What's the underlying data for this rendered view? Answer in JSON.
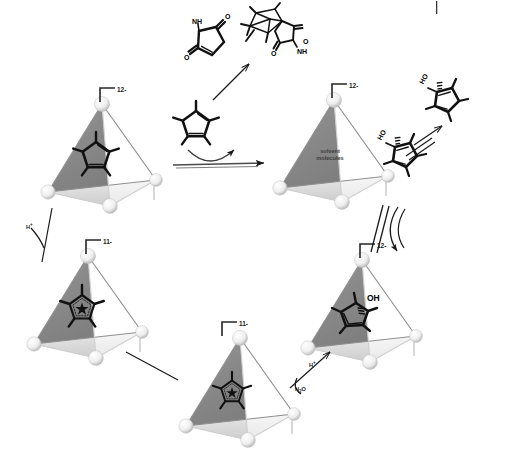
{
  "figure": {
    "type": "reaction-cycle-diagram",
    "background_color": "#ffffff"
  },
  "palette": {
    "face_dark": "#8c8c8c",
    "face_mid": "#b5b5b5",
    "face_light": "#e6e6e6",
    "edge": "#8a8a8a",
    "vertex": "#f2f2f2",
    "vertex_shadow": "#b0b0b0",
    "bond": "#111111",
    "arrow": "#1a1a1a",
    "text": "#000000"
  },
  "hosts": [
    {
      "id": "host-cp-neutral",
      "name": "host-with-pentamethylcyclopentadiene",
      "charge_label": "12-",
      "position": {
        "x": 44,
        "y": 96
      },
      "guest": "pentamethylcyclopentadiene",
      "guest_style": "cyclopentadiene-diene"
    },
    {
      "id": "host-solvent",
      "name": "host-with-solvent",
      "charge_label": "12-",
      "position": {
        "x": 276,
        "y": 92
      },
      "guest": "solvent molecules",
      "guest_label_line1": "solvent",
      "guest_label_line2": "molecules",
      "guest_style": "text"
    },
    {
      "id": "host-cp-anion-left",
      "name": "host-with-cyclopentadienyl-anion",
      "charge_label": "11-",
      "position": {
        "x": 30,
        "y": 248
      },
      "guest": "pentamethylcyclopentadienyl anion",
      "guest_style": "aromatic-star"
    },
    {
      "id": "host-cp-anion-bottom",
      "name": "host-with-cyclopentadienyl-anion",
      "charge_label": "11-",
      "position": {
        "x": 182,
        "y": 330
      },
      "guest": "pentamethylcyclopentadienyl anion",
      "guest_style": "aromatic-star"
    },
    {
      "id": "host-cp-alcohol",
      "name": "host-with-cyclopentadienol",
      "charge_label": "12-",
      "position": {
        "x": 304,
        "y": 252
      },
      "guest": "pentamethylcyclopentadienol",
      "guest_style": "alcohol",
      "guest_atom_label": "OH"
    }
  ],
  "molecules": [
    {
      "id": "maleimide",
      "name": "maleimide",
      "position": {
        "x": 192,
        "y": 25
      },
      "atom_labels": [
        "NH",
        "O",
        "O"
      ]
    },
    {
      "id": "diels-alder-adduct",
      "name": "diels-alder-adduct",
      "position": {
        "x": 244,
        "y": 4
      },
      "atom_labels": [
        "O",
        "NH",
        "O"
      ]
    },
    {
      "id": "free-cp-diene",
      "name": "pentamethylcyclopentadiene",
      "position": {
        "x": 162,
        "y": 102
      },
      "atom_labels": []
    },
    {
      "id": "cp-enol-upper",
      "name": "cyclopentadienol-isomer-upper",
      "position": {
        "x": 434,
        "y": 100
      },
      "atom_labels": [
        "HO"
      ]
    },
    {
      "id": "cp-enol-lower",
      "name": "cyclopentadienol-isomer-lower",
      "position": {
        "x": 380,
        "y": 148
      },
      "atom_labels": [
        "HO"
      ]
    }
  ],
  "annotations": [
    {
      "id": "hplus-left",
      "name": "proton-label",
      "text": "H",
      "superscript": "+",
      "x": 26,
      "y": 222
    },
    {
      "id": "hplus-bottom",
      "name": "proton-label",
      "text": "H",
      "superscript": "+",
      "x": 309,
      "y": 360
    },
    {
      "id": "water",
      "name": "water-label",
      "text": "H",
      "subscript": "2",
      "suffix": "O",
      "x": 297,
      "y": 386
    }
  ],
  "arrows": [
    {
      "id": "arrow-encapsulation",
      "name": "encapsulation-reaction-arrow",
      "type": "straight-right",
      "label": ""
    },
    {
      "id": "arrow-da",
      "name": "diels-alder-arrow",
      "type": "diagonal-up-right",
      "label": ""
    },
    {
      "id": "arrow-tautomer",
      "name": "tautomerization-equilibrium",
      "type": "equilibrium",
      "label": ""
    },
    {
      "id": "arrow-uptake",
      "name": "guest-uptake-equilibrium",
      "type": "equilibrium",
      "label": ""
    },
    {
      "id": "arrow-protonation",
      "name": "protonation-arrow",
      "type": "diagonal",
      "label": ""
    },
    {
      "id": "arrow-deprotonation",
      "name": "deprotonation-arrow",
      "type": "diagonal",
      "label": ""
    },
    {
      "id": "arrow-exchange",
      "name": "guest-exchange-arrow",
      "type": "diagonal",
      "label": ""
    }
  ],
  "page_marks": [
    {
      "id": "crop-tick",
      "name": "crop-mark",
      "x": 436,
      "y": 1,
      "width": 1,
      "height": 13
    }
  ]
}
